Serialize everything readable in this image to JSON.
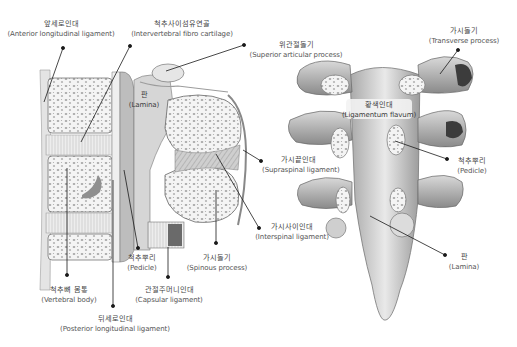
{
  "figure": {
    "colors": {
      "line": "#1a1a1a",
      "bone_light": "#f2f2f2",
      "bone_mid": "#b5b5b5",
      "bone_dark": "#6e6e6e",
      "background": "#ffffff"
    },
    "left_view": {
      "name": "Sagittal section of lumbar spine",
      "labels": [
        {
          "id": "anterior-longitudinal-ligament",
          "ko": "앞세로인대",
          "en": "(Anterior longitudinal ligament)"
        },
        {
          "id": "intervertebral-fibro-cartilage",
          "ko": "척추사이섬유연골",
          "en": "(Intervertebral fibro cartilage)"
        },
        {
          "id": "superior-articular-process",
          "ko": "위관절돌기",
          "en": "(Superior articular process)"
        },
        {
          "id": "lamina-left",
          "ko": "판",
          "en": "(Lamina)"
        },
        {
          "id": "supraspinal-ligament",
          "ko": "가시끝인대",
          "en": "(Supraspinal ligament)"
        },
        {
          "id": "interspinal-ligament",
          "ko": "가시사이인대",
          "en": "(Interspinal ligament)"
        },
        {
          "id": "spinous-process",
          "ko": "가시돌기",
          "en": "(Spinous process)"
        },
        {
          "id": "pedicle-left",
          "ko": "척추뿌리",
          "en": "(Pedicle)"
        },
        {
          "id": "capsular-ligament",
          "ko": "관절주머니인대",
          "en": "(Capsular ligament)"
        },
        {
          "id": "vertebral-body",
          "ko": "척추뼈 몸통",
          "en": "(Vertebral body)"
        },
        {
          "id": "posterior-longitudinal-ligament",
          "ko": "뒤세로인대",
          "en": "(Posterior longitudinal ligament)"
        }
      ]
    },
    "right_view": {
      "name": "Posterior view of vertebral arches",
      "labels": [
        {
          "id": "transverse-process",
          "ko": "가시돌기",
          "en": "(Transverse process)"
        },
        {
          "id": "ligamentum-flavum",
          "ko": "황색인대",
          "en": "(Ligamentum flavum)"
        },
        {
          "id": "pedicle-right",
          "ko": "척추뿌리",
          "en": "(Pedicle)"
        },
        {
          "id": "lamina-right",
          "ko": "판",
          "en": "(Lamina)"
        }
      ]
    }
  }
}
